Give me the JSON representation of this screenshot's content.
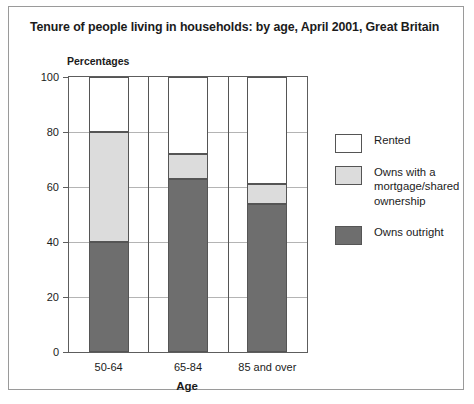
{
  "chart_data": {
    "type": "bar",
    "subtype": "stacked-bar-100-percent",
    "title": "Tenure of people living in households: by age, April 2001, Great Britain",
    "units_label": "Percentages",
    "xlabel": "Age",
    "ylabel": "",
    "categories": [
      "50-64",
      "65-84",
      "85 and over"
    ],
    "ylim": [
      0,
      100
    ],
    "yticks": [
      0,
      20,
      40,
      60,
      80,
      100
    ],
    "ytick_labels": [
      "0",
      "20",
      "40",
      "60",
      "80",
      "100"
    ],
    "grid": true,
    "legend_position": "right",
    "series": [
      {
        "name": "Owns outright",
        "color": "#6e6e6e",
        "values": [
          40,
          63,
          54
        ]
      },
      {
        "name": "Owns with a mortgage/shared ownership",
        "color": "#dcdcdc",
        "values": [
          40,
          9,
          7
        ]
      },
      {
        "name": "Rented",
        "color": "#ffffff",
        "values": [
          20,
          28,
          39
        ]
      }
    ],
    "cumulative_tops": {
      "50-64": {
        "outright": 40,
        "mortgage": 80,
        "rented": 100
      },
      "65-84": {
        "outright": 63,
        "mortgage": 72,
        "rented": 100
      },
      "85 and over": {
        "outright": 54,
        "mortgage": 61,
        "rented": 100
      }
    }
  },
  "legend": {
    "items": [
      {
        "label": "Rented",
        "swatch": "rented"
      },
      {
        "label": "Owns with a mortgage/shared ownership",
        "swatch": "mortgage"
      },
      {
        "label": "Owns outright",
        "swatch": "outright"
      }
    ]
  }
}
